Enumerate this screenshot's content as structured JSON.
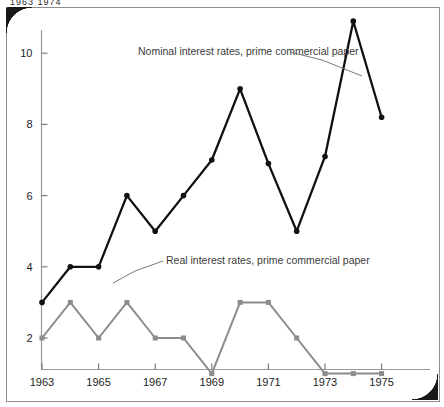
{
  "page": {
    "top_caption": "1963  1974"
  },
  "chart_data": {
    "type": "line",
    "title": "",
    "xlabel": "",
    "ylabel": "",
    "x": [
      1963,
      1964,
      1965,
      1966,
      1967,
      1968,
      1969,
      1970,
      1971,
      1972,
      1973,
      1974,
      1975
    ],
    "xtick_labels": [
      "1963",
      "1965",
      "1967",
      "1969",
      "1971",
      "1973",
      "1975"
    ],
    "xtick_values": [
      1963,
      1965,
      1967,
      1969,
      1971,
      1973,
      1975
    ],
    "ytick_labels": [
      "2",
      "4",
      "6",
      "8",
      "10"
    ],
    "ytick_values": [
      2,
      4,
      6,
      8,
      10
    ],
    "xlim": [
      1962.6,
      1975.6
    ],
    "ylim": [
      0,
      11.6
    ],
    "grid": false,
    "legend_position": "inline-annotation",
    "series": [
      {
        "name": "Nominal interest rates, prime commercial paper",
        "color": "#111111",
        "marker": "circle",
        "label_text": "Nominal interest rates, prime commercial paper",
        "values": [
          3.0,
          4.0,
          4.0,
          6.0,
          5.0,
          6.0,
          7.0,
          9.0,
          6.9,
          5.0,
          7.1,
          10.9,
          8.2
        ]
      },
      {
        "name": "Real interest rates, prime commercial paper",
        "color": "#8c8c8c",
        "marker": "square",
        "label_text": "Real interest rates, prime commercial paper",
        "values": [
          2.0,
          3.0,
          2.0,
          3.0,
          2.0,
          2.0,
          1.0,
          3.0,
          3.0,
          2.0,
          1.0,
          1.0,
          1.0
        ]
      }
    ],
    "annotations": [
      {
        "text": "Nominal interest rates, prime commercial paper",
        "text_x": 138,
        "text_y": 55,
        "leader": [
          [
            290,
            52
          ],
          [
            322,
            60
          ],
          [
            362,
            76
          ]
        ]
      },
      {
        "text": "Real interest rates, prime commercial paper",
        "text_x": 166,
        "text_y": 264,
        "leader": [
          [
            163,
            261
          ],
          [
            135,
            271
          ],
          [
            113,
            283
          ]
        ]
      }
    ]
  }
}
